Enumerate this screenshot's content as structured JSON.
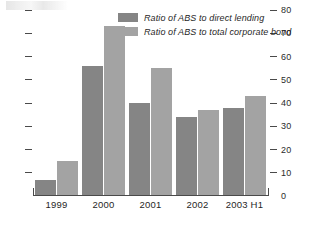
{
  "chart_data": {
    "type": "bar",
    "title": "",
    "subtitle": "",
    "xlabel": "",
    "ylabel": "",
    "categories": [
      "1999",
      "2000",
      "2001",
      "2002",
      "2003 H1"
    ],
    "series": [
      {
        "name": "Ratio of ABS to direct lending",
        "color": "#858585",
        "values": [
          7,
          56,
          40,
          34,
          38
        ]
      },
      {
        "name": "Ratio of ABS to total corporate bond",
        "color": "#a3a3a3",
        "values": [
          15,
          73,
          55,
          37,
          43
        ]
      }
    ],
    "ylim": [
      0,
      80
    ],
    "ytick_values": [
      0,
      10,
      20,
      30,
      40,
      50,
      60,
      70,
      80
    ],
    "ytick_labels": [
      "0",
      "10",
      "20",
      "30",
      "40",
      "50",
      "60",
      "70",
      "80"
    ],
    "y_axis_position": "right",
    "left_axis_ticks_unlabeled": true,
    "grid": false,
    "legend_position": "top-center"
  },
  "legend": {
    "items": [
      {
        "label": "Ratio of ABS to direct lending",
        "swatch": "dark"
      },
      {
        "label": "Ratio of ABS to total corporate bond",
        "swatch": "light"
      }
    ]
  },
  "axis": {
    "right_labels": [
      "80",
      "70",
      "60",
      "50",
      "40",
      "30",
      "20",
      "10",
      "0"
    ]
  }
}
